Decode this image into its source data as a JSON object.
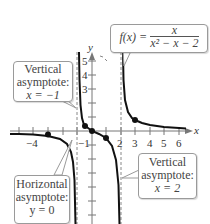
{
  "function": {
    "lhs": "f(x) =",
    "numerator": "x",
    "denominator": "x² − x − 2"
  },
  "axes": {
    "x_label": "x",
    "y_label": "y",
    "x_ticks": [
      "−4",
      "−1",
      "2",
      "3",
      "4",
      "5",
      "6"
    ],
    "y_ticks": [
      "5",
      "4",
      "3"
    ]
  },
  "callouts": {
    "vertical_asymptote_left": {
      "line1": "Vertical",
      "line2": "asymptote:",
      "line3": "x = −1"
    },
    "horizontal_asymptote": {
      "line1": "Horizontal",
      "line2": "asymptote:",
      "line3": "y = 0"
    },
    "vertical_asymptote_right": {
      "line1": "Vertical",
      "line2": "asymptote:",
      "line3": "x = 2"
    }
  },
  "asymptotes": {
    "vertical": [
      -1,
      2
    ],
    "horizontal": 0
  },
  "marked_points": [
    {
      "x": -4,
      "y": -0.22
    },
    {
      "x": -0.5,
      "y": 0.4
    },
    {
      "x": 0,
      "y": 0
    },
    {
      "x": 1,
      "y": -0.5
    },
    {
      "x": 3,
      "y": 0.75
    }
  ],
  "colors": {
    "curve": "#111111",
    "axis": "#777777",
    "asymptote": "#888888",
    "callout_border": "#9a9a9a"
  }
}
